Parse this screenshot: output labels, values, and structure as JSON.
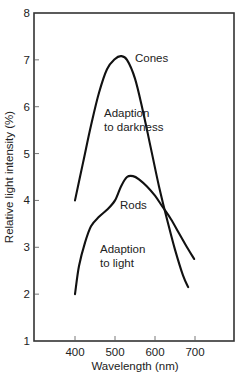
{
  "chart_data": {
    "type": "line",
    "title": "",
    "xlabel": "Wavelength (nm)",
    "ylabel": "Relative light intensity (%)",
    "xlim": [
      310,
      800
    ],
    "ylim": [
      1,
      8
    ],
    "x_ticks": [
      400,
      500,
      600,
      700
    ],
    "y_ticks": [
      1,
      2,
      3,
      4,
      5,
      6,
      7,
      8
    ],
    "grid": false,
    "legend": "none (inline curve annotations)",
    "series": [
      {
        "name": "Cones",
        "annotation": "Adaption to darkness",
        "x": [
          400,
          420,
          440,
          460,
          480,
          500,
          515,
          530,
          550,
          570,
          590,
          610,
          630,
          650,
          670,
          683
        ],
        "y": [
          4.0,
          4.8,
          5.6,
          6.3,
          6.8,
          7.02,
          7.08,
          7.0,
          6.6,
          5.9,
          5.1,
          4.3,
          3.6,
          2.95,
          2.4,
          2.15
        ]
      },
      {
        "name": "Rods",
        "annotation": "Adaption to light",
        "x": [
          400,
          410,
          425,
          440,
          460,
          480,
          500,
          515,
          530,
          545,
          560,
          580,
          600,
          620,
          640,
          660,
          680,
          698
        ],
        "y": [
          2.0,
          2.6,
          3.1,
          3.45,
          3.65,
          3.8,
          4.0,
          4.3,
          4.5,
          4.52,
          4.45,
          4.3,
          4.1,
          3.85,
          3.6,
          3.3,
          3.0,
          2.75
        ]
      }
    ],
    "annotations": [
      {
        "text": "Cones",
        "x": 540,
        "y": 7.1
      },
      {
        "text": "Adaption",
        "x": 472,
        "y": 6.05
      },
      {
        "text": "to darkness",
        "x": 472,
        "y": 5.75
      },
      {
        "text": "Rods",
        "x": 532,
        "y": 3.85
      },
      {
        "text": "Adaption",
        "x": 469,
        "y": 3.0
      },
      {
        "text": "to light",
        "x": 469,
        "y": 2.7
      }
    ]
  },
  "labels": {
    "xlabel": "Wavelength (nm)",
    "ylabel": "Relative light intensity (%)",
    "cones": "Cones",
    "dark_1": "Adaption",
    "dark_2": "to darkness",
    "rods": "Rods",
    "light_1": "Adaption",
    "light_2": "to light"
  },
  "colors": {
    "line": "#111111",
    "frame": "#333333",
    "text": "#222222"
  }
}
